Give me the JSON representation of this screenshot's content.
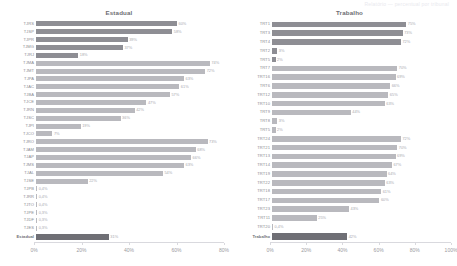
{
  "topstrip": {
    "text": "Relatório — percentual por tribunal"
  },
  "panels": [
    {
      "key": "estadual",
      "title": "Estadual",
      "axis": {
        "ticks": [
          "0%",
          "20%",
          "40%",
          "60%",
          "80%"
        ],
        "max": 80
      },
      "total": {
        "label": "Estadual",
        "value": 31,
        "value_label": "31%"
      }
    },
    {
      "key": "trabalho",
      "title": "Trabalho",
      "axis": {
        "ticks": [
          "0%",
          "20%",
          "40%",
          "60%",
          "80%",
          "100%"
        ],
        "max": 100
      },
      "total": {
        "label": "Trabalho",
        "value": 42,
        "value_label": "42%"
      }
    }
  ],
  "chart_data": [
    {
      "type": "bar",
      "orientation": "horizontal",
      "title": "Estadual",
      "xlabel": "",
      "ylabel": "",
      "xlim": [
        0,
        80
      ],
      "grid": false,
      "tick_labels": [
        "0%",
        "20%",
        "40%",
        "60%",
        "80%"
      ],
      "categories": [
        "TJRS",
        "TJSP",
        "TJPR",
        "TJMG",
        "TJRJ",
        "TJMA",
        "TJMT",
        "TJPA",
        "TJAM",
        "TJBA",
        "TJCE",
        "TJRN",
        "TJSC",
        "TJPI",
        "TJCO",
        "TJRO",
        "TJAM",
        "TJAP",
        "TJMS",
        "TJAL",
        "TJSE",
        "TJPB",
        "TJRR",
        "TJSE",
        "TJPE",
        "TJPB",
        "TJAC"
      ],
      "values": [
        60,
        58,
        39,
        37,
        18,
        74,
        72,
        63,
        61,
        57,
        47,
        42,
        36,
        19,
        7,
        73,
        68,
        66,
        63,
        54,
        22,
        0.4,
        0.4,
        0.4,
        0.3,
        0.3,
        0.3
      ],
      "value_labels": [
        "60%",
        "58%",
        "39%",
        "37%",
        "18%",
        "74%",
        "72%",
        "63%",
        "61%",
        "57%",
        "47%",
        "42%",
        "36%",
        "19%",
        "7%",
        "73%",
        "68%",
        "66%",
        "63%",
        "54%",
        "22%",
        "0,4%",
        "0,4%",
        "0,4%",
        "0,3%",
        "0,3%",
        "0,3%"
      ],
      "total_category": "Estadual",
      "total_value": 31,
      "total_value_label": "31%"
    },
    {
      "type": "bar",
      "orientation": "horizontal",
      "title": "Trabalho",
      "xlabel": "",
      "ylabel": "",
      "xlim": [
        0,
        100
      ],
      "grid": false,
      "tick_labels": [
        "0%",
        "20%",
        "40%",
        "60%",
        "80%",
        "100%"
      ],
      "categories": [
        "TRT1",
        "TRT3",
        "TRT4",
        "TRT2",
        "TRT5",
        "TRT7",
        "TRT16",
        "TRT6",
        "TRT12",
        "TRT10",
        "TRT9",
        "TRT8",
        "TRT5",
        "TRT24",
        "TRT21",
        "TRT13",
        "TRT14",
        "TRT19",
        "TRT22",
        "TRT14",
        "TRT17",
        "TRT23",
        "TRT11",
        "TRT20"
      ],
      "values": [
        75,
        73,
        72,
        3,
        2,
        70,
        69,
        66,
        65,
        63,
        62,
        44,
        2,
        72,
        70,
        69,
        67,
        64,
        63,
        61,
        60,
        43,
        25,
        0.4
      ],
      "value_labels": [
        "75%",
        "73%",
        "72%",
        "3%",
        "2%",
        "70%",
        "69%",
        "66%",
        "65%",
        "63%",
        "62%",
        "44%",
        "2%",
        "72%",
        "70%",
        "69%",
        "67%",
        "64%",
        "63%",
        "61%",
        "60%",
        "43%",
        "25%",
        "0,4%"
      ],
      "total_category": "Trabalho",
      "total_value": 42,
      "total_value_label": "42%"
    }
  ],
  "estadual_rows": [
    {
      "label": "TJRS",
      "value": 60,
      "label_text": "60%",
      "dark": true
    },
    {
      "label": "TJSP",
      "value": 58,
      "label_text": "58%",
      "dark": true
    },
    {
      "label": "TJPR",
      "value": 39,
      "label_text": "39%",
      "dark": true
    },
    {
      "label": "TJMG",
      "value": 37,
      "label_text": "37%",
      "dark": true
    },
    {
      "label": "TJRJ",
      "value": 18,
      "label_text": "18%",
      "dark": true
    },
    {
      "label": "TJMA",
      "value": 74,
      "label_text": "74%",
      "dark": false
    },
    {
      "label": "TJMT",
      "value": 72,
      "label_text": "72%",
      "dark": false
    },
    {
      "label": "TJPA",
      "value": 63,
      "label_text": "63%",
      "dark": false
    },
    {
      "label": "TJAC",
      "value": 61,
      "label_text": "61%",
      "dark": false
    },
    {
      "label": "TJBA",
      "value": 57,
      "label_text": "57%",
      "dark": false
    },
    {
      "label": "TJCE",
      "value": 47,
      "label_text": "47%",
      "dark": false
    },
    {
      "label": "TJRN",
      "value": 42,
      "label_text": "42%",
      "dark": false
    },
    {
      "label": "TJSC",
      "value": 36,
      "label_text": "36%",
      "dark": false
    },
    {
      "label": "TJPI",
      "value": 19,
      "label_text": "19%",
      "dark": false
    },
    {
      "label": "TJCO",
      "value": 7,
      "label_text": "7%",
      "dark": false
    },
    {
      "label": "TJRO",
      "value": 73,
      "label_text": "73%",
      "dark": false
    },
    {
      "label": "TJAM",
      "value": 68,
      "label_text": "68%",
      "dark": false
    },
    {
      "label": "TJAP",
      "value": 66,
      "label_text": "66%",
      "dark": false
    },
    {
      "label": "TJMS",
      "value": 63,
      "label_text": "63%",
      "dark": false
    },
    {
      "label": "TJAL",
      "value": 54,
      "label_text": "54%",
      "dark": false
    },
    {
      "label": "TJSE",
      "value": 22,
      "label_text": "22%",
      "dark": false
    },
    {
      "label": "TJPB",
      "value": 0.4,
      "label_text": "0,4%",
      "dark": false
    },
    {
      "label": "TJRR",
      "value": 0.4,
      "label_text": "0,4%",
      "dark": false
    },
    {
      "label": "TJTO",
      "value": 0.4,
      "label_text": "0,4%",
      "dark": false
    },
    {
      "label": "TJPE",
      "value": 0.3,
      "label_text": "0,3%",
      "dark": false
    },
    {
      "label": "TJDF",
      "value": 0.3,
      "label_text": "0,3%",
      "dark": false
    },
    {
      "label": "TJES",
      "value": 0.3,
      "label_text": "0,3%",
      "dark": false
    }
  ],
  "trabalho_rows": [
    {
      "label": "TRT1",
      "value": 75,
      "label_text": "75%",
      "dark": true
    },
    {
      "label": "TRT3",
      "value": 73,
      "label_text": "73%",
      "dark": true
    },
    {
      "label": "TRT4",
      "value": 72,
      "label_text": "72%",
      "dark": true
    },
    {
      "label": "TRT2",
      "value": 3,
      "label_text": "3%",
      "dark": true
    },
    {
      "label": "TRT5",
      "value": 2,
      "label_text": "2%",
      "dark": true
    },
    {
      "label": "TRT7",
      "value": 70,
      "label_text": "70%",
      "dark": false
    },
    {
      "label": "TRT16",
      "value": 69,
      "label_text": "69%",
      "dark": false
    },
    {
      "label": "TRT6",
      "value": 66,
      "label_text": "66%",
      "dark": false
    },
    {
      "label": "TRT12",
      "value": 65,
      "label_text": "65%",
      "dark": false
    },
    {
      "label": "TRT10",
      "value": 63,
      "label_text": "63%",
      "dark": false
    },
    {
      "label": "TRT9",
      "value": 44,
      "label_text": "44%",
      "dark": false
    },
    {
      "label": "TRT8",
      "value": 3,
      "label_text": "3%",
      "dark": false
    },
    {
      "label": "TRT5",
      "value": 2,
      "label_text": "2%",
      "dark": false
    },
    {
      "label": "TRT24",
      "value": 72,
      "label_text": "72%",
      "dark": false
    },
    {
      "label": "TRT21",
      "value": 70,
      "label_text": "70%",
      "dark": false
    },
    {
      "label": "TRT13",
      "value": 69,
      "label_text": "69%",
      "dark": false
    },
    {
      "label": "TRT14",
      "value": 67,
      "label_text": "67%",
      "dark": false
    },
    {
      "label": "TRT19",
      "value": 64,
      "label_text": "64%",
      "dark": false
    },
    {
      "label": "TRT22",
      "value": 63,
      "label_text": "63%",
      "dark": false
    },
    {
      "label": "TRT18",
      "value": 61,
      "label_text": "61%",
      "dark": false
    },
    {
      "label": "TRT17",
      "value": 60,
      "label_text": "60%",
      "dark": false
    },
    {
      "label": "TRT23",
      "value": 43,
      "label_text": "43%",
      "dark": false
    },
    {
      "label": "TRT11",
      "value": 25,
      "label_text": "25%",
      "dark": false
    },
    {
      "label": "TRT20",
      "value": 0.4,
      "label_text": "0,4%",
      "dark": false
    }
  ]
}
